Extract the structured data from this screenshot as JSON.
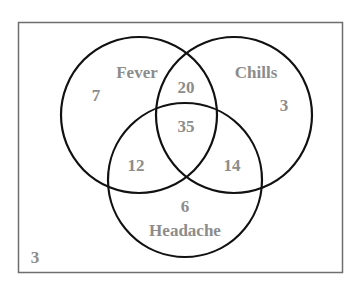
{
  "diagram": {
    "type": "venn",
    "universe": {
      "outside_count": "3"
    },
    "sets": [
      {
        "name": "Fever",
        "only_count": "7"
      },
      {
        "name": "Chills",
        "only_count": "3"
      },
      {
        "name": "Headache",
        "only_count": "6"
      }
    ],
    "intersections": {
      "fever_chills_only": "20",
      "fever_headache_only": "12",
      "chills_headache_only": "14",
      "all_three": "35"
    },
    "colors": {
      "circle_stroke": "#111111",
      "frame_stroke": "#6e6e6e",
      "label_text": "#8c8c8c",
      "background": "#ffffff"
    }
  }
}
